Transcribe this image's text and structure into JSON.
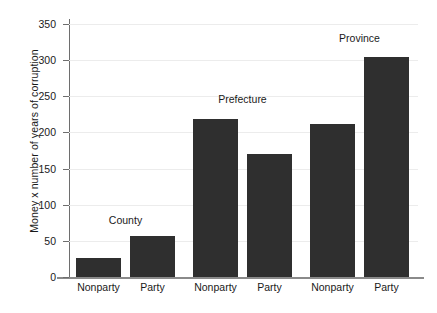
{
  "chart_data": {
    "type": "bar",
    "title": "",
    "xlabel": "",
    "ylabel": "Money x number of years of corruption",
    "ylim": [
      0,
      350
    ],
    "ytick_labels": [
      "0",
      "50",
      "100",
      "150",
      "200",
      "250",
      "300",
      "350"
    ],
    "ytick_values": [
      0,
      50,
      100,
      150,
      200,
      250,
      300,
      350
    ],
    "grid": true,
    "legend": "none",
    "group_labels": [
      "County",
      "Prefecture",
      "Province"
    ],
    "categories": [
      "Nonparty",
      "Party",
      "Nonparty",
      "Party",
      "Nonparty",
      "Party"
    ],
    "values": [
      26,
      57,
      219,
      170,
      212,
      304
    ],
    "bars": [
      {
        "group": "County",
        "category": "Nonparty",
        "value": 26
      },
      {
        "group": "County",
        "category": "Party",
        "value": 57
      },
      {
        "group": "Prefecture",
        "category": "Nonparty",
        "value": 219
      },
      {
        "group": "Prefecture",
        "category": "Party",
        "value": 170
      },
      {
        "group": "Province",
        "category": "Nonparty",
        "value": 212
      },
      {
        "group": "Province",
        "category": "Party",
        "value": 304
      }
    ],
    "colors": {
      "bar": "#2f2f2f",
      "grid": "#ececec",
      "axis": "#6e6e6e",
      "text": "#1a1a1a",
      "background": "#ffffff"
    }
  }
}
